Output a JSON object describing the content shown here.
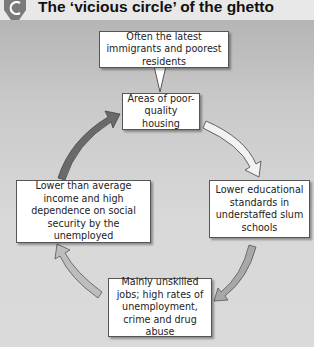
{
  "header": {
    "badge_letter": "C",
    "title": "The ‘vicious circle’ of the ghetto"
  },
  "diagram": {
    "callout": {
      "text": "Often the latest immigrants and poorest residents"
    },
    "nodes": [
      {
        "id": "housing",
        "text": "Areas of poor-quality housing"
      },
      {
        "id": "education",
        "text": "Lower educational standards in understaffed slum schools"
      },
      {
        "id": "jobs",
        "text": "Mainly unskilled jobs; high rates of unemployment, crime and drug abuse"
      },
      {
        "id": "income",
        "text": "Lower than average income and high dependence on social security by the unemployed"
      }
    ],
    "arrows": [
      {
        "from": "income",
        "to": "housing",
        "fill": "#6a6a6a"
      },
      {
        "from": "housing",
        "to": "education",
        "fill": "#f2f2f2"
      },
      {
        "from": "education",
        "to": "jobs",
        "fill": "#a8a8a8"
      },
      {
        "from": "jobs",
        "to": "income",
        "fill": "#bdbdbd"
      }
    ]
  }
}
